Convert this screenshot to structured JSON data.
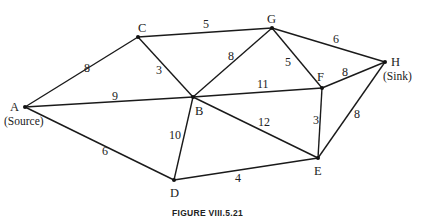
{
  "caption": "FIGURE VIII.5.21",
  "nodes": [
    {
      "id": "A",
      "label": "A",
      "sublabel": "(Source)",
      "x": 25,
      "y": 107,
      "lx": 10,
      "ly": 111,
      "sx": 4,
      "sy": 125
    },
    {
      "id": "B",
      "label": "B",
      "x": 193,
      "y": 97,
      "lx": 195,
      "ly": 115
    },
    {
      "id": "C",
      "label": "C",
      "x": 138,
      "y": 37,
      "lx": 138,
      "ly": 32
    },
    {
      "id": "D",
      "label": "D",
      "x": 174,
      "y": 180,
      "lx": 170,
      "ly": 197
    },
    {
      "id": "E",
      "label": "E",
      "x": 318,
      "y": 158,
      "lx": 314,
      "ly": 175
    },
    {
      "id": "F",
      "label": "F",
      "x": 322,
      "y": 88,
      "lx": 317,
      "ly": 81
    },
    {
      "id": "G",
      "label": "G",
      "x": 272,
      "y": 28,
      "lx": 267,
      "ly": 23
    },
    {
      "id": "H",
      "label": "H",
      "sublabel": "(Sink)",
      "x": 385,
      "y": 62,
      "lx": 391,
      "ly": 66,
      "sx": 383,
      "sy": 80
    }
  ],
  "edges": [
    {
      "from": "A",
      "to": "C",
      "capacity": "8",
      "lx": 84,
      "ly": 72
    },
    {
      "from": "A",
      "to": "B",
      "capacity": "9",
      "lx": 112,
      "ly": 100
    },
    {
      "from": "A",
      "to": "D",
      "capacity": "6",
      "lx": 102,
      "ly": 155
    },
    {
      "from": "C",
      "to": "G",
      "capacity": "5",
      "lx": 203,
      "ly": 28
    },
    {
      "from": "C",
      "to": "B",
      "capacity": "3",
      "lx": 156,
      "ly": 74
    },
    {
      "from": "B",
      "to": "G",
      "capacity": "8",
      "lx": 228,
      "ly": 60
    },
    {
      "from": "B",
      "to": "F",
      "capacity": "11",
      "lx": 257,
      "ly": 88
    },
    {
      "from": "B",
      "to": "E",
      "capacity": "12",
      "lx": 258,
      "ly": 126
    },
    {
      "from": "B",
      "to": "D",
      "capacity": "10",
      "lx": 169,
      "ly": 139
    },
    {
      "from": "G",
      "to": "F",
      "capacity": "5",
      "lx": 285,
      "ly": 66
    },
    {
      "from": "G",
      "to": "H",
      "capacity": "6",
      "lx": 333,
      "ly": 43
    },
    {
      "from": "F",
      "to": "H",
      "capacity": "8",
      "lx": 342,
      "ly": 76
    },
    {
      "from": "F",
      "to": "E",
      "capacity": "3",
      "lx": 313,
      "ly": 124
    },
    {
      "from": "E",
      "to": "H",
      "capacity": "8",
      "lx": 354,
      "ly": 118
    },
    {
      "from": "D",
      "to": "E",
      "capacity": "4",
      "lx": 235,
      "ly": 182
    }
  ]
}
